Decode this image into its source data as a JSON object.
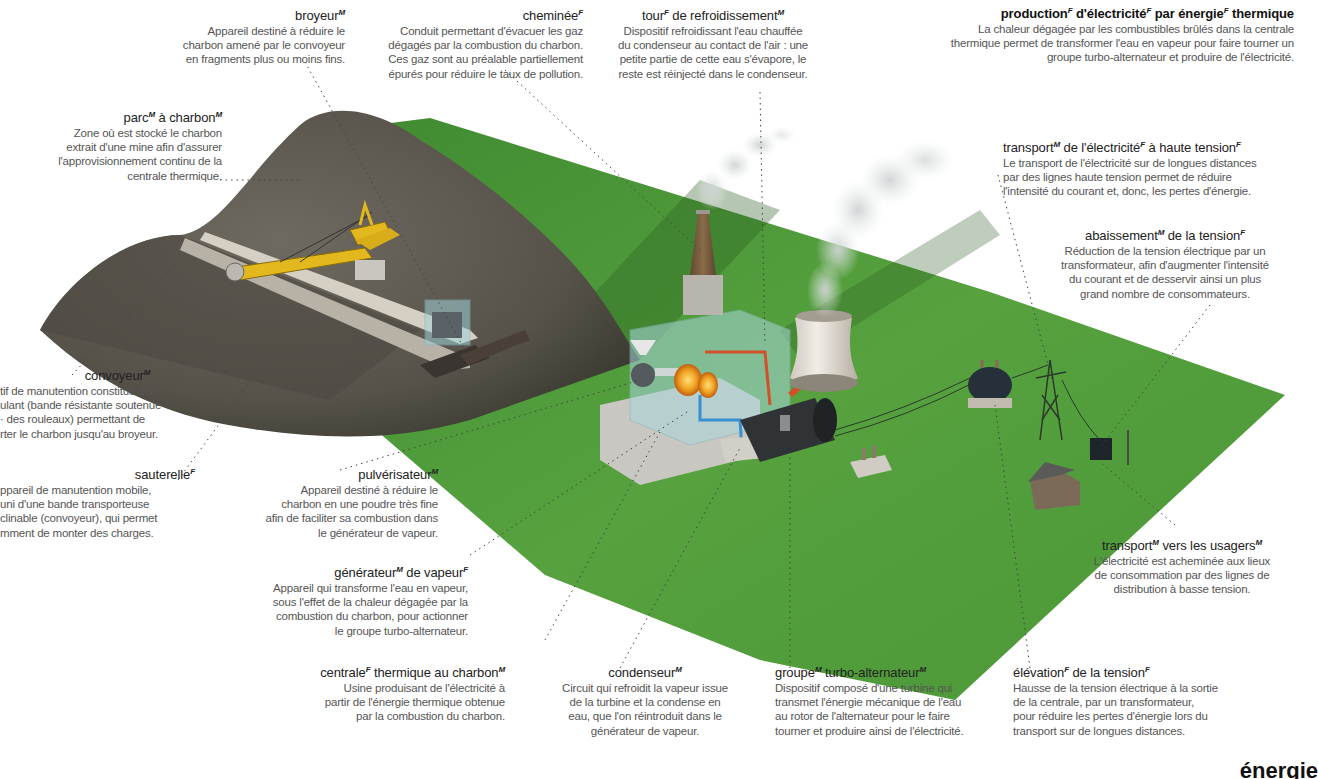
{
  "title": {
    "term": "production d'électricité par énergie thermique",
    "parts": [
      {
        "w": "production",
        "g": "F"
      },
      {
        "w": "d'électricité",
        "g": "F"
      },
      {
        "w": "par énergie",
        "g": "F"
      },
      {
        "w": "thermique",
        "g": ""
      }
    ],
    "desc": "La chaleur dégagée par les combustibles brûlés dans la centrale\nthermique permet de transformer l'eau en vapeur pour faire tourner un\ngroupe turbo-alternateur et produire de l'électricité."
  },
  "labels": {
    "broyeur": {
      "parts": [
        {
          "w": "broyeur",
          "g": "M"
        }
      ],
      "desc": "Appareil destiné à réduire le\ncharbon amené par le convoyeur\nen fragments plus ou moins fins."
    },
    "cheminee": {
      "parts": [
        {
          "w": "cheminée",
          "g": "F"
        }
      ],
      "desc": "Conduit permettant d'évacuer les gaz\ndégagés par la combustion du charbon.\nCes gaz sont au préalable partiellement\népurés pour réduire le taux de pollution."
    },
    "tour": {
      "parts": [
        {
          "w": "tour",
          "g": "F"
        },
        {
          "w": " de refroidissement",
          "g": "M"
        }
      ],
      "desc": "Dispositif refroidissant l'eau chauffée\ndu condenseur au contact de l'air : une\npetite partie de cette eau s'évapore, le\nreste est réinjecté dans le condenseur."
    },
    "parc": {
      "parts": [
        {
          "w": "parc",
          "g": "M"
        },
        {
          "w": " à charbon",
          "g": "M"
        }
      ],
      "desc": "Zone où est stocké le charbon\nextrait d'une mine afin d'assurer\nl'approvisionnement continu de la\ncentrale thermique."
    },
    "transport_ht": {
      "parts": [
        {
          "w": "transport",
          "g": "M"
        },
        {
          "w": " de l'électricité",
          "g": "F"
        },
        {
          "w": " à haute tension",
          "g": "F"
        }
      ],
      "desc": "Le transport de l'électricité sur de longues distances\npar des lignes haute tension permet de réduire\nl'intensité du courant et, donc, les pertes d'énergie."
    },
    "abaissement": {
      "parts": [
        {
          "w": "abaissement",
          "g": "M"
        },
        {
          "w": " de la tension",
          "g": "F"
        }
      ],
      "desc": "Réduction de la tension électrique par un\ntransformateur, afin d'augmenter l'intensité\ndu courant et de desservir ainsi un plus\ngrand nombre de consommateurs."
    },
    "convoyeur": {
      "parts": [
        {
          "w": "convoyeur",
          "g": "M"
        }
      ],
      "desc": "tif de manutention constitué d'un\nulant (bande résistante soutenue\n· des rouleaux) permettant de\nrter le charbon jusqu'au broyeur."
    },
    "sauterelle": {
      "parts": [
        {
          "w": "sauterelle",
          "g": "F"
        }
      ],
      "desc": "ppareil de manutention mobile,\nuni d'une bande transporteuse\nclinable (convoyeur), qui permet\nmment de monter des charges."
    },
    "pulverisateur": {
      "parts": [
        {
          "w": "pulvérisateur",
          "g": "M"
        }
      ],
      "desc": "Appareil destiné à réduire le\ncharbon en une poudre très fine\nafin de faciliter sa combustion dans\nle générateur de vapeur."
    },
    "generateur": {
      "parts": [
        {
          "w": "générateur",
          "g": "M"
        },
        {
          "w": " de vapeur",
          "g": "F"
        }
      ],
      "desc": "Appareil qui transforme l'eau en vapeur,\nsous l'effet de la chaleur dégagée par la\ncombustion du charbon, pour actionner\nle groupe turbo-alternateur."
    },
    "centrale": {
      "parts": [
        {
          "w": "centrale",
          "g": "F"
        },
        {
          "w": " thermique au charbon",
          "g": "M"
        }
      ],
      "desc": "Usine produisant de l'électricité à\npartir de l'énergie thermique obtenue\npar la combustion du charbon."
    },
    "condenseur": {
      "parts": [
        {
          "w": "condenseur",
          "g": "M"
        }
      ],
      "desc": "Circuit qui refroidit la vapeur issue\nde la turbine et la condense en\neau, que l'on réintroduit dans le\ngénérateur de vapeur."
    },
    "groupe": {
      "parts": [
        {
          "w": "groupe",
          "g": "M"
        },
        {
          "w": " turbo-alternateur",
          "g": "M"
        }
      ],
      "desc": "Dispositif composé d'une turbine qui\ntransmet l'énergie mécanique de l'eau\nau rotor de l'alternateur pour le faire\ntourner et produire ainsi de l'électricité."
    },
    "elevation": {
      "parts": [
        {
          "w": "élévation",
          "g": "F"
        },
        {
          "w": " de la tension",
          "g": "F"
        }
      ],
      "desc": "Hausse de la tension électrique à la sortie\nde la centrale, par un transformateur,\npour réduire les pertes d'énergie lors du\ntransport sur de longues distances."
    },
    "usagers": {
      "parts": [
        {
          "w": "transport",
          "g": "M"
        },
        {
          "w": " vers les usagers",
          "g": "M"
        }
      ],
      "desc": "L'électricité est acheminée aux lieux\nde consommation par des lignes de\ndistribution à basse tension."
    }
  },
  "footer_cut_text": "énergie",
  "colors": {
    "grass": "#4f9a3a",
    "grass_dark": "#2f6e25",
    "coal_pile": "#5e5a52",
    "excavator": "#e3b81f",
    "chimney": "#7a6040",
    "tower": "#e6e1da",
    "hot_pipe": "#d2502a",
    "cold_pipe": "#3a8fd0"
  }
}
